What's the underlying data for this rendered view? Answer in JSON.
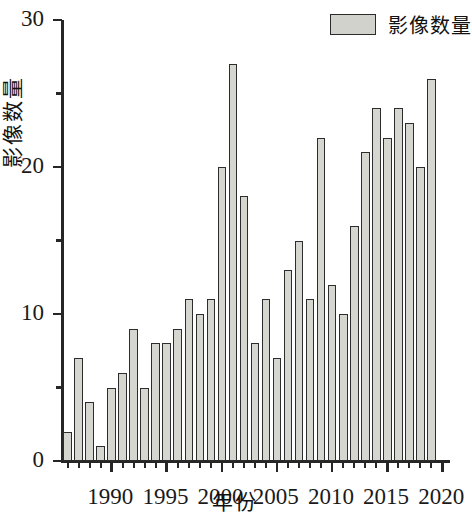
{
  "chart_data": {
    "type": "bar",
    "title": "",
    "xlabel": "年份",
    "ylabel": "影像数量",
    "legend": [
      {
        "name": "影像数量",
        "color": "#d6d6d1"
      }
    ],
    "legend_position": "top-right",
    "grid": false,
    "ylim": [
      0,
      30
    ],
    "y_ticks": [
      0,
      10,
      20,
      30
    ],
    "y_tick_labels": [
      "0",
      "10",
      "20",
      "30"
    ],
    "y_minor_ticks": [
      5,
      15,
      25
    ],
    "xlim": [
      1985.5,
      2020.5
    ],
    "x_ticks": [
      1990,
      1995,
      2000,
      2005,
      2010,
      2015,
      2020
    ],
    "x_tick_labels": [
      "1990",
      "1995",
      "2000",
      "2005",
      "2010",
      "2015",
      "2020"
    ],
    "categories": [
      "1986",
      "1987",
      "1988",
      "1989",
      "1990",
      "1991",
      "1992",
      "1993",
      "1994",
      "1995",
      "1996",
      "1997",
      "1998",
      "1999",
      "2000",
      "2001",
      "2002",
      "2003",
      "2004",
      "2005",
      "2006",
      "2007",
      "2008",
      "2009",
      "2010",
      "2011",
      "2012",
      "2013",
      "2014",
      "2015",
      "2016",
      "2017",
      "2018",
      "2019"
    ],
    "values": [
      2,
      7,
      4,
      1,
      5,
      6,
      9,
      5,
      8,
      8,
      9,
      11,
      10,
      11,
      20,
      27,
      18,
      8,
      11,
      7,
      13,
      15,
      11,
      22,
      12,
      10,
      16,
      21,
      24,
      22,
      24,
      23,
      20,
      26
    ],
    "series": [
      {
        "name": "影像数量",
        "values": [
          2,
          7,
          4,
          1,
          5,
          6,
          9,
          5,
          8,
          8,
          9,
          11,
          10,
          11,
          20,
          27,
          18,
          8,
          11,
          7,
          13,
          15,
          11,
          22,
          12,
          10,
          16,
          21,
          24,
          22,
          24,
          23,
          20,
          26
        ]
      }
    ],
    "bar_face_color": "#d6d6d1",
    "bar_edge_color": "#2d2d2d",
    "axis_color": "#262626"
  }
}
